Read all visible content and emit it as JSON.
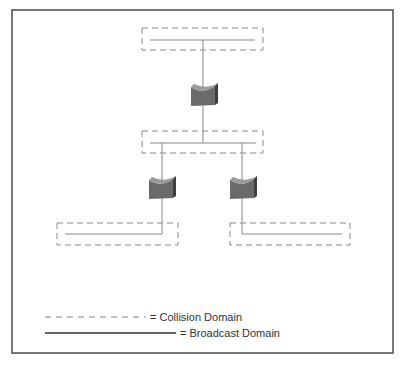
{
  "diagram": {
    "type": "network-topology",
    "colors": {
      "frame": "#555555",
      "line": "#888888",
      "dash": "#8a8a8a",
      "device_front": "#6a6a6a",
      "device_top": "#9a9a9a",
      "device_side": "#3f3f3f",
      "legend_solid": "#333333"
    },
    "nodes": [
      {
        "id": "segment-top",
        "kind": "lan-segment"
      },
      {
        "id": "bridge-top",
        "kind": "bridge-icon"
      },
      {
        "id": "segment-middle",
        "kind": "lan-segment"
      },
      {
        "id": "bridge-left",
        "kind": "bridge-icon"
      },
      {
        "id": "bridge-right",
        "kind": "bridge-icon"
      },
      {
        "id": "segment-bottom-left",
        "kind": "lan-segment"
      },
      {
        "id": "segment-bottom-right",
        "kind": "lan-segment"
      }
    ],
    "edges": [
      [
        "segment-top",
        "bridge-top"
      ],
      [
        "bridge-top",
        "segment-middle"
      ],
      [
        "segment-middle",
        "bridge-left"
      ],
      [
        "segment-middle",
        "bridge-right"
      ],
      [
        "bridge-left",
        "segment-bottom-left"
      ],
      [
        "bridge-right",
        "segment-bottom-right"
      ]
    ],
    "collision_domains": 4
  },
  "legend": {
    "collision": {
      "symbol": "dashed-line",
      "label": "= Collision Domain"
    },
    "broadcast": {
      "symbol": "solid-line",
      "label": "= Broadcast Domain"
    }
  }
}
